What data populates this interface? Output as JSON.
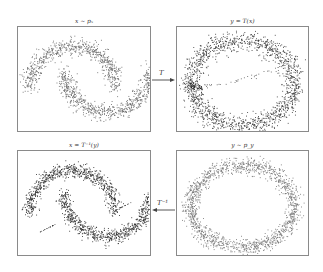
{
  "figure": {
    "panels": [
      {
        "id": "top-left",
        "title": "x ~ p_x",
        "title_display": "x ∼ pₓ",
        "shape": "two-moons",
        "point_color": "#6b6b6b"
      },
      {
        "id": "top-right",
        "title": "y = T(x)",
        "title_display": "y = T(x)",
        "shape": "ring-with-artifacts",
        "point_color": "#3a3a3a"
      },
      {
        "id": "bottom-left",
        "title": "x = T^-1(y)",
        "title_display": "x = T⁻¹(y)",
        "shape": "two-moons-dense",
        "point_color": "#2e2e2e"
      },
      {
        "id": "bottom-right",
        "title": "y ~ p_y",
        "title_display": "y ∼ p_y",
        "shape": "ring",
        "point_color": "#777777"
      }
    ],
    "arrows": [
      {
        "id": "forward",
        "label": "T",
        "direction": "right",
        "from": "top-left",
        "to": "top-right"
      },
      {
        "id": "inverse",
        "label": "T⁻¹",
        "direction": "left",
        "from": "bottom-right",
        "to": "bottom-left"
      }
    ],
    "colors": {
      "frame": "#8a8a8a",
      "arrow": "#444444",
      "text": "#333333"
    }
  }
}
